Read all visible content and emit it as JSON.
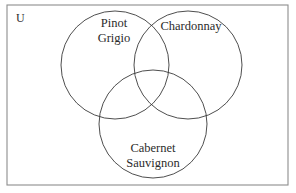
{
  "figure": {
    "type": "venn-diagram-3-set",
    "background_color": "#ffffff",
    "border_color": "#8d8d8d",
    "circle_color": "#3a3a3a",
    "text_color": "#2b2b2b"
  },
  "universe": {
    "label": "U",
    "label_x": 16,
    "label_y": 19,
    "rect": {
      "x": 7,
      "y": 5,
      "width": 281,
      "height": 180
    }
  },
  "sets": [
    {
      "id": "pinot-grigio",
      "name": "Pinot Grigio",
      "label_lines": [
        "Pinot",
        "Grigio"
      ],
      "cx": 115,
      "cy": 65,
      "r": 54,
      "label_x": 114,
      "label_y": 24,
      "line_height": 15
    },
    {
      "id": "chardonnay",
      "name": "Chardonnay",
      "label_lines": [
        "Chardonnay"
      ],
      "cx": 188,
      "cy": 65,
      "r": 54,
      "label_x": 191,
      "label_y": 27,
      "line_height": 15
    },
    {
      "id": "cabernet-sauvignon",
      "name": "Cabernet Sauvignon",
      "label_lines": [
        "Cabernet",
        "Sauvignon"
      ],
      "cx": 153,
      "cy": 124,
      "r": 54,
      "label_x": 153,
      "label_y": 149,
      "line_height": 15
    }
  ]
}
